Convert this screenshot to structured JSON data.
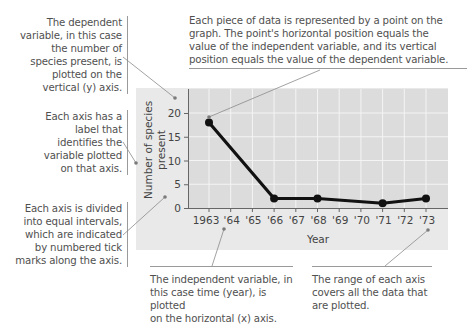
{
  "annotations": {
    "dependent_variable": "The dependent variable, in this case the number of species present, is plotted on the vertical (y) axis.",
    "dependent_variable_lines": [
      "The dependent",
      "variable, in this case",
      "the number of",
      "species present, is",
      "plotted on the",
      "vertical (y) axis."
    ],
    "axis_label": "Each axis has a label that identifies the variable plotted on that axis.",
    "axis_label_lines": [
      "Each axis has a",
      "label that",
      "identifies the",
      "variable plotted",
      "on that axis."
    ],
    "intervals": "Each axis is divided into equal intervals, which are indicated by numbered tick marks along the axis.",
    "intervals_lines": [
      "Each axis is divided",
      "into equal intervals,",
      "which are indicated",
      "by numbered tick",
      "marks along the axis."
    ],
    "data_point": "Each piece of data is represented by a point on the graph. The point's horizontal position equals the value of the independent variable, and its vertical position equals the value of the dependent variable.",
    "data_point_lines": [
      "Each piece of data is represented by a point on the",
      "graph. The point's horizontal position equals the",
      "value of the independent variable, and its vertical",
      "position equals the value of the dependent variable."
    ],
    "independent_variable": "The independent variable, in this case time (year), is plotted on the horizontal (x) axis.",
    "independent_variable_lines": [
      "The independent variable, in",
      "this case time (year), is plotted",
      "on the horizontal (x) axis."
    ],
    "range": "The range of each axis covers all the data that are plotted.",
    "range_lines": [
      "The range of each axis",
      "covers all the data that",
      "are plotted."
    ]
  },
  "colors": {
    "panel": "#e9e9e9",
    "plot_area": "#dcdcdc",
    "grid": "#f4f4f4",
    "line": "#111111",
    "leader": "#8a8a8a"
  },
  "chart_data": {
    "type": "line",
    "title": "",
    "xlabel": "Year",
    "ylabel": "Number of species present",
    "ylabel_lines": [
      "Number of species",
      "present"
    ],
    "x": [
      1963,
      1966,
      1968,
      1971,
      1973
    ],
    "values": [
      18,
      2,
      2,
      1,
      2
    ],
    "x_tick_labels": [
      "1963",
      "'64",
      "'65",
      "'66",
      "'67",
      "'68",
      "'69",
      "'70",
      "'71",
      "'72",
      "'73"
    ],
    "y_tick_labels": [
      "0",
      "5",
      "10",
      "15",
      "20"
    ],
    "xlim": [
      1963,
      1973
    ],
    "ylim": [
      0,
      24
    ],
    "grid": true,
    "legend": "none"
  }
}
